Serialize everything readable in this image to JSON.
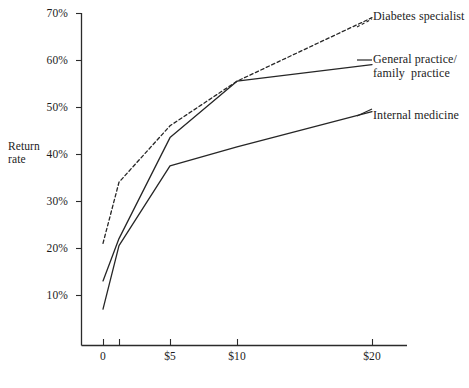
{
  "chart_data": {
    "type": "line",
    "title": "",
    "xlabel": "",
    "ylabel": "Return rate",
    "x": [
      "0",
      "$1",
      "$5",
      "$10",
      "$20"
    ],
    "x_positions": [
      0,
      1,
      5,
      10,
      20
    ],
    "categories": [
      "0",
      "$1",
      "$5",
      "$10",
      "$20"
    ],
    "xtick_labels": [
      "0",
      "$5",
      "$10",
      "$20"
    ],
    "ytick_labels": [
      "10%",
      "20%",
      "30%",
      "40%",
      "50%",
      "60%",
      "70%"
    ],
    "ytick_values": [
      10,
      20,
      30,
      40,
      50,
      60,
      70
    ],
    "ylim": [
      5,
      70
    ],
    "grid": false,
    "legend_position": "right-inline-labels",
    "series": [
      {
        "name": "Diabetes specialist",
        "style": "dashed",
        "values": [
          21,
          34,
          46,
          55.5,
          69
        ]
      },
      {
        "name": "General practice/\nfamily  practice",
        "style": "solid",
        "values": [
          13,
          22,
          43.5,
          55.5,
          59
        ]
      },
      {
        "name": "Internal medicine",
        "style": "solid",
        "values": [
          7,
          20.5,
          37.5,
          41.5,
          49
        ]
      }
    ]
  },
  "axes": {
    "y_title_line1": "Return",
    "y_title_line2": "rate",
    "y_labels": [
      "70%",
      "60%",
      "50%",
      "40%",
      "30%",
      "20%",
      "10%"
    ],
    "x_labels": [
      "0",
      "$5",
      "$10",
      "$20"
    ]
  },
  "series_labels": {
    "diabetes": "Diabetes specialist",
    "general_line1": "General practice/",
    "general_line2": "family  practice",
    "internal": "Internal medicine"
  },
  "colors": {
    "ink": "#262626",
    "background": "#ffffff"
  }
}
